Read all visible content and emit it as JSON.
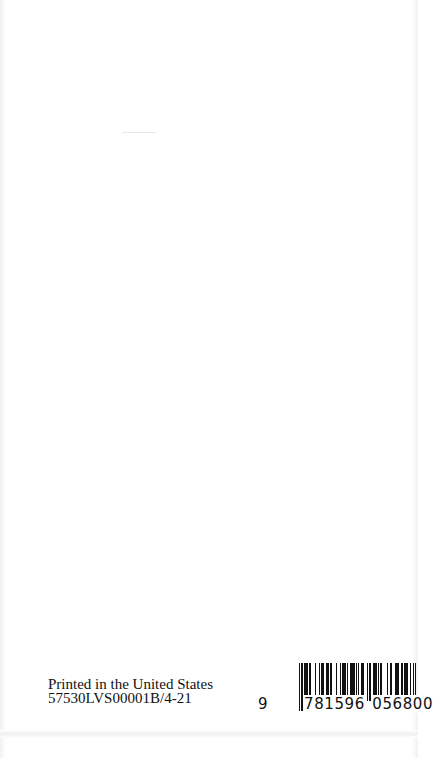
{
  "page": {
    "type": "book-back-page",
    "background": "#ffffff"
  },
  "printer_info": {
    "line1": "Printed in the United States",
    "line2": "57530LVS00001B/4-21"
  },
  "barcode": {
    "lead_digit": "9",
    "left_group": "781596",
    "right_group": "056800",
    "full": "9781596056800",
    "bar_color": "#111111"
  }
}
